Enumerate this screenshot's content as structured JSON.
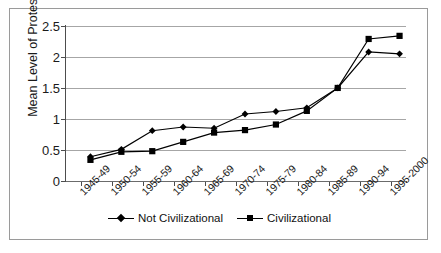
{
  "chart_data": {
    "type": "line",
    "title": "",
    "xlabel": "",
    "ylabel": "Mean Level of Protest",
    "ylim": [
      0,
      2.5
    ],
    "ytick_labels": [
      "0",
      "0.5",
      "1",
      "1.5",
      "2",
      "2.5"
    ],
    "ytick_values": [
      0,
      0.5,
      1,
      1.5,
      2,
      2.5
    ],
    "grid": true,
    "legend_position": "bottom",
    "categories": [
      "1945-49",
      "1950-54",
      "1955-59",
      "1960-64",
      "1965-69",
      "1970-74",
      "1975-79",
      "1980-84",
      "1985-89",
      "1990-94",
      "1995-2000"
    ],
    "series": [
      {
        "name": "Not Civilizational",
        "marker": "diamond",
        "values": [
          0.52,
          0.64,
          0.94,
          1.0,
          0.98,
          1.21,
          1.25,
          1.31,
          1.63,
          2.21,
          2.18
        ]
      },
      {
        "name": "Civilizational",
        "marker": "square",
        "values": [
          0.47,
          0.6,
          0.61,
          0.76,
          0.91,
          0.95,
          1.04,
          1.26,
          1.63,
          2.42,
          2.47
        ]
      }
    ]
  },
  "legend": {
    "entries": [
      {
        "label": "Not Civilizational",
        "marker": "diamond"
      },
      {
        "label": "Civilizational",
        "marker": "square"
      }
    ]
  },
  "colors": {
    "series_line": "#000000",
    "gridline": "#a6a6a6",
    "axis": "#4d4d4d",
    "border": "#9a9a9a",
    "background": "#ffffff",
    "text": "#1a1a1a"
  }
}
